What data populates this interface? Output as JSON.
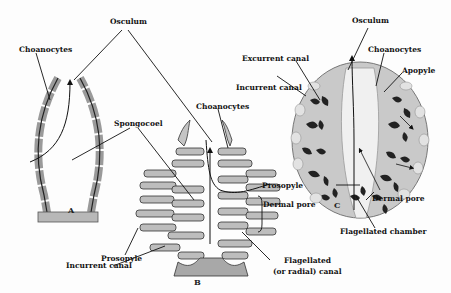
{
  "colors": {
    "wall": "#b8b8b8",
    "wall_dark": "#8a8a8a",
    "ink": "#111111",
    "background": "#fdfdfd"
  },
  "captions": {
    "a": "A",
    "b": "B",
    "c": "C"
  },
  "labels": {
    "osculum_ab": "Osculum",
    "choanocytes_a": "Choanocytes",
    "spongocoel": "Spongocoel",
    "choanocytes_b": "Choanocytes",
    "prosopyle_b": "Prosopyle",
    "dermal_pore_b": "Dermal pore",
    "incurrent_canal_b": "Incurrent canal",
    "flagellated_canal_line1": "Flagellated",
    "flagellated_canal_line2": "(or radial) canal",
    "osculum_c": "Osculum",
    "excurrent_canal": "Excurrent canal",
    "choanocytes_c": "Choanocytes",
    "incurrent_canal_c": "Incurrent canal",
    "apopyle": "Apopyle",
    "prosopyle_c": "Prosopyle",
    "dermal_pore_c": "Dermal pore",
    "flagellated_chamber": "Flagellated chamber"
  }
}
